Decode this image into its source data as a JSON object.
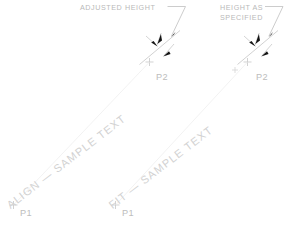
{
  "drawing": {
    "background_color": "#ffffff",
    "line_color": "#c8c8c8",
    "arrow_color": "#1a1a1a",
    "text_color": "#cccccc",
    "label_color": "#b9b9b9"
  },
  "callouts": [
    {
      "id": "adjusted-height",
      "text": "ADJUSTED  HEIGHT",
      "lines": [
        "ADJUSTED  HEIGHT"
      ]
    },
    {
      "id": "height-as-specified",
      "text": "HEIGHT  AS SPECIFIED",
      "lines": [
        "HEIGHT  AS",
        "SPECIFIED"
      ]
    }
  ],
  "examples": [
    {
      "id": "align",
      "mode_label": "ALIGN",
      "sample_text": "ALIGN — SAMPLE TEXT",
      "start_point_label": "P1",
      "end_point_label": "P2",
      "callout": "ADJUSTED  HEIGHT"
    },
    {
      "id": "fit",
      "mode_label": "FIT",
      "sample_text": "FIT — SAMPLE TEXT",
      "start_point_label": "P1",
      "end_point_label": "P2",
      "callout": "HEIGHT  AS SPECIFIED"
    }
  ],
  "point_labels": {
    "left_start": "P1",
    "left_end": "P2",
    "right_start": "P1",
    "right_end": "P2"
  }
}
